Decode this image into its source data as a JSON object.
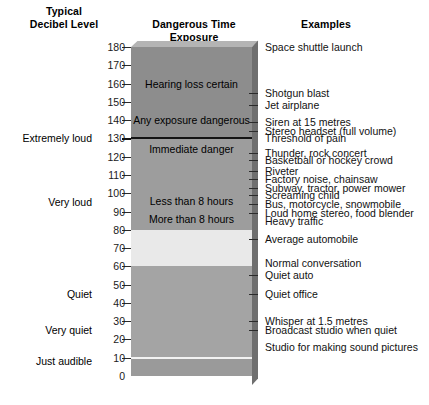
{
  "headers": {
    "decibel_level": "Typical\nDecibel Level",
    "decibel_level_line1": "Typical",
    "decibel_level_line2": "Decibel Level",
    "exposure": "Dangerous Time Exposure",
    "examples": "Examples"
  },
  "colors": {
    "band_extreme": "#8d8d8d",
    "band_very_loud": "#9d9d9d",
    "band_light": "#e9e9e9",
    "band_lower": "#a4a4a4",
    "band_bottom": "#9a9a9a",
    "bar_top_bevel": "#b4b4b4",
    "bar_side": "#6f6f6f",
    "rule_dark": "#141414",
    "rule_white": "#f2f2f2",
    "tick": "#2b2b2b",
    "text": "#000000",
    "background": "#ffffff"
  },
  "chart_data": {
    "type": "bar",
    "title": "Typical Decibel Level",
    "xlabel": "",
    "ylabel": "Decibel Level (dB)",
    "ylim": [
      0,
      180
    ],
    "grid": false,
    "legend": "none",
    "axis_ticks": [
      0,
      10,
      20,
      30,
      40,
      50,
      60,
      70,
      80,
      90,
      100,
      110,
      120,
      130,
      140,
      150,
      160,
      170,
      180
    ],
    "loudness_categories": [
      {
        "label": "Extremely loud",
        "db": 130
      },
      {
        "label": "Very loud",
        "db": 95
      },
      {
        "label": "Quiet",
        "db": 45
      },
      {
        "label": "Very quiet",
        "db": 25
      },
      {
        "label": "Just audible",
        "db": 8
      }
    ],
    "exposure_bands": [
      {
        "label": "Hearing loss certain",
        "db_min": 150,
        "db_max": 180,
        "db_center": 160,
        "color": "#8d8d8d"
      },
      {
        "label": "Any exposure dangerous",
        "db_min": 130,
        "db_max": 150,
        "db_center": 140,
        "color": "#8d8d8d"
      },
      {
        "label": "Immediate danger",
        "db_min": 115,
        "db_max": 130,
        "db_center": 124,
        "color": "#9d9d9d"
      },
      {
        "label": "Less than 8 hours",
        "db_min": 90,
        "db_max": 115,
        "db_center": 96,
        "color": "#9d9d9d"
      },
      {
        "label": "More than 8 hours",
        "db_min": 80,
        "db_max": 90,
        "db_center": 86,
        "color": "#9d9d9d"
      }
    ],
    "examples": [
      {
        "text": "Space shuttle launch",
        "db": 180
      },
      {
        "text": "Shotgun blast",
        "db": 155
      },
      {
        "text": "Jet airplane",
        "db": 148
      },
      {
        "text": "Siren at 15 metres",
        "db": 139
      },
      {
        "text": "Stereo headset (full volume)",
        "db": 134
      },
      {
        "text": "Threshold of pain",
        "db": 130
      },
      {
        "text": "Thunder, rock concert",
        "db": 122
      },
      {
        "text": "Basketball or hockey crowd",
        "db": 118
      },
      {
        "text": "Riveter",
        "db": 112
      },
      {
        "text": "Factory noise, chainsaw",
        "db": 108
      },
      {
        "text": "Subway, tractor, power mower",
        "db": 103
      },
      {
        "text": "Screaming child",
        "db": 99
      },
      {
        "text": "Bus, motorcycle, snowmobile",
        "db": 94
      },
      {
        "text": "Loud home stereo, food blender",
        "db": 89
      },
      {
        "text": "Heavy traffic",
        "db": 85
      },
      {
        "text": "Average automobile",
        "db": 75
      },
      {
        "text": "Normal conversation",
        "db": 62
      },
      {
        "text": "Quiet auto",
        "db": 55
      },
      {
        "text": "Quiet office",
        "db": 45
      },
      {
        "text": "Whisper at 1.5 metres",
        "db": 30
      },
      {
        "text": "Broadcast studio when quiet",
        "db": 25
      },
      {
        "text": "Studio for making sound pictures",
        "db": 16
      }
    ],
    "tick_marks_right_db": [
      155,
      148,
      139,
      134,
      122,
      118,
      112,
      108,
      103,
      99,
      94,
      89,
      75,
      55,
      45,
      30,
      25
    ],
    "rules": [
      {
        "db": 130,
        "color": "#141414",
        "thickness": 2
      },
      {
        "db": 10,
        "color": "#f2f2f2",
        "thickness": 2
      }
    ]
  }
}
